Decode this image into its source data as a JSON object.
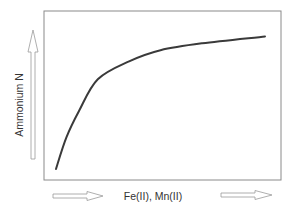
{
  "chart_data": {
    "type": "line",
    "title": "",
    "xlabel": "Fe(II), Mn(II)",
    "ylabel": "Ammonium N",
    "x_ticks": [],
    "y_ticks": [],
    "grid": false,
    "legend": null,
    "axis_direction_arrows": {
      "x": "increasing to right",
      "y": "increasing upward"
    },
    "series": [
      {
        "name": "Ammonium N vs Fe(II), Mn(II)",
        "x": [
          0.0,
          0.05,
          0.11,
          0.2,
          0.35,
          0.5,
          0.7,
          1.0
        ],
        "y": [
          0.0,
          0.23,
          0.42,
          0.65,
          0.78,
          0.86,
          0.91,
          0.96
        ]
      }
    ],
    "xlim": [
      0,
      1
    ],
    "ylim": [
      0,
      1.05
    ]
  },
  "labels": {
    "x_axis": "Fe(II), Mn(II)",
    "y_axis": "Ammonium N"
  },
  "colors": {
    "curve": "#3a3a3a",
    "frame": "#8a8a8a",
    "arrow": "#9a9a9a",
    "text": "#333333"
  }
}
